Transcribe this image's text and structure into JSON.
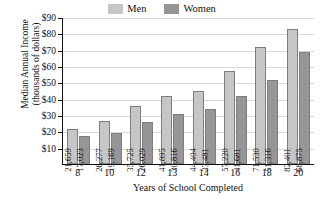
{
  "chart_data": {
    "type": "bar",
    "title": "",
    "xlabel": "Years of School Completed",
    "ylabel_line1": "Median Annual Income",
    "ylabel_line2": "(thousands of dollars)",
    "categories": [
      "8",
      "10",
      "12",
      "13",
      "14",
      "16",
      "18",
      "20"
    ],
    "ylim": [
      0,
      90
    ],
    "yticks": [
      10,
      20,
      30,
      40,
      50,
      60,
      70,
      80,
      90
    ],
    "ytick_labels": [
      "$10",
      "$20",
      "$30",
      "$40",
      "$50",
      "$60",
      "$70",
      "$80",
      "$90"
    ],
    "grid": true,
    "legend_position": "top-center",
    "series": [
      {
        "name": "Men",
        "color": "#c6c6c6",
        "values": [
          21659,
          26277,
          35725,
          41895,
          44404,
          57220,
          71530,
          82401
        ],
        "labels": [
          "21,659",
          "26,277",
          "35,725",
          "41,895",
          "44,404",
          "57,220",
          "71,530",
          "82,401"
        ]
      },
      {
        "name": "Women",
        "color": "#969696",
        "values": [
          17023,
          19169,
          26029,
          30816,
          33481,
          41681,
          51316,
          68875
        ],
        "labels": [
          "17,023",
          "19,169",
          "26,029",
          "30,816",
          "33,481",
          "41,681",
          "51,316",
          "68,875"
        ]
      }
    ]
  }
}
